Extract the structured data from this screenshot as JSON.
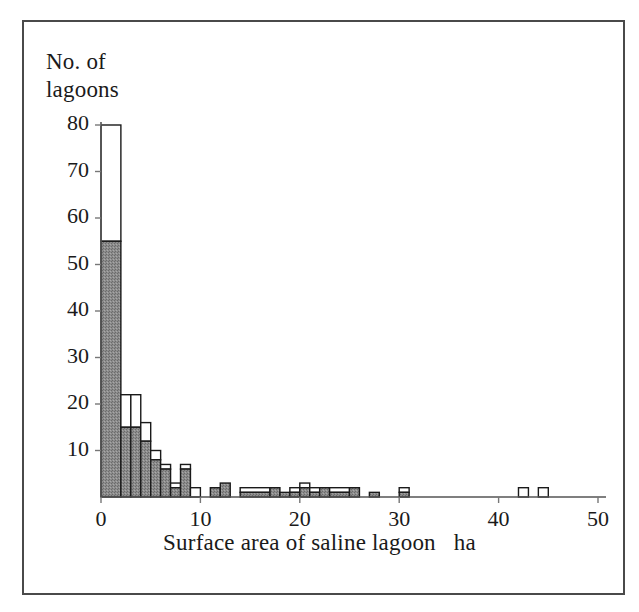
{
  "figure": {
    "background_color": "#ffffff",
    "frame_color": "#4a4a4a",
    "bar_fill_color": "#808080",
    "bar_edge_color": "#1a1a1a",
    "bar_open_color": "#ffffff"
  },
  "axes": {
    "ylabel_line1": "No. of",
    "ylabel_line2": "lagoons",
    "xlabel": "Surface area of saline lagoon",
    "xunit": "ha",
    "yticks": [
      0,
      10,
      20,
      30,
      40,
      50,
      60,
      70,
      80
    ],
    "ytick_labels": [
      "",
      "10",
      "20",
      "30",
      "40",
      "50",
      "60",
      "70",
      "80"
    ],
    "xticks": [
      0,
      10,
      20,
      30,
      40,
      50
    ],
    "xtick_labels": [
      "0",
      "10",
      "20",
      "30",
      "40",
      "50"
    ]
  },
  "chart_data": {
    "type": "bar",
    "title": "",
    "xlabel": "Surface area of saline lagoon   ha",
    "ylabel": "No. of lagoons",
    "xlim": [
      0,
      50
    ],
    "ylim": [
      0,
      80
    ],
    "grid": false,
    "legend": false,
    "bin_width": 1,
    "note": "Stacked histogram: shaded (grey) portion plus open (white) portion give the total bar height.",
    "bin_starts": [
      0,
      1,
      2,
      3,
      4,
      5,
      6,
      7,
      8,
      9,
      10,
      11,
      12,
      13,
      14,
      15,
      16,
      17,
      18,
      19,
      20,
      21,
      22,
      23,
      24,
      25,
      26,
      27,
      28,
      29,
      30,
      31,
      32,
      33,
      34,
      35,
      36,
      37,
      38,
      39,
      40,
      41,
      42,
      43,
      44,
      45,
      46,
      47,
      48,
      49
    ],
    "series": [
      {
        "name": "shaded",
        "values": [
          55,
          55,
          15,
          15,
          12,
          12,
          8,
          8,
          6,
          6,
          4,
          4,
          2,
          2,
          2,
          2,
          2,
          2,
          2,
          2,
          1,
          1,
          2,
          2,
          1,
          1,
          1,
          1,
          0,
          0,
          1,
          1,
          0,
          0,
          0,
          0,
          0,
          0,
          0,
          0,
          0,
          0,
          0,
          0,
          0,
          0,
          0,
          0,
          0,
          0
        ]
      },
      {
        "name": "open",
        "values": [
          25,
          25,
          7,
          7,
          4,
          4,
          1,
          1,
          1,
          1,
          3,
          3,
          0,
          0,
          0,
          0,
          0,
          0,
          0,
          0,
          1,
          1,
          1,
          1,
          0,
          0,
          0,
          0,
          0,
          0,
          0,
          0,
          0,
          0,
          0,
          0,
          0,
          0,
          0,
          0,
          0,
          0,
          1,
          1,
          1,
          1,
          0,
          0,
          0,
          0
        ]
      }
    ],
    "bars": [
      {
        "x0": 0,
        "x1": 2,
        "shaded": 55,
        "open": 25
      },
      {
        "x0": 2,
        "x1": 3,
        "shaded": 15,
        "open": 7
      },
      {
        "x0": 3,
        "x1": 4,
        "shaded": 15,
        "open": 7
      },
      {
        "x0": 4,
        "x1": 5,
        "shaded": 12,
        "open": 4
      },
      {
        "x0": 5,
        "x1": 6,
        "shaded": 8,
        "open": 2
      },
      {
        "x0": 6,
        "x1": 7,
        "shaded": 6,
        "open": 1
      },
      {
        "x0": 7,
        "x1": 8,
        "shaded": 2,
        "open": 1
      },
      {
        "x0": 8,
        "x1": 9,
        "shaded": 6,
        "open": 1
      },
      {
        "x0": 9,
        "x1": 10,
        "shaded": 0,
        "open": 2
      },
      {
        "x0": 11,
        "x1": 12,
        "shaded": 2,
        "open": 0
      },
      {
        "x0": 12,
        "x1": 13,
        "shaded": 3,
        "open": 0
      },
      {
        "x0": 14,
        "x1": 17,
        "shaded": 1,
        "open": 1
      },
      {
        "x0": 17,
        "x1": 18,
        "shaded": 2,
        "open": 0
      },
      {
        "x0": 18,
        "x1": 19,
        "shaded": 1,
        "open": 0
      },
      {
        "x0": 19,
        "x1": 20,
        "shaded": 1,
        "open": 1
      },
      {
        "x0": 20,
        "x1": 21,
        "shaded": 2,
        "open": 1
      },
      {
        "x0": 21,
        "x1": 22,
        "shaded": 1,
        "open": 1
      },
      {
        "x0": 22,
        "x1": 23,
        "shaded": 2,
        "open": 0
      },
      {
        "x0": 23,
        "x1": 25,
        "shaded": 1,
        "open": 1
      },
      {
        "x0": 25,
        "x1": 26,
        "shaded": 2,
        "open": 0
      },
      {
        "x0": 27,
        "x1": 28,
        "shaded": 1,
        "open": 0
      },
      {
        "x0": 30,
        "x1": 31,
        "shaded": 1,
        "open": 1
      },
      {
        "x0": 42,
        "x1": 43,
        "shaded": 0,
        "open": 2
      },
      {
        "x0": 44,
        "x1": 45,
        "shaded": 0,
        "open": 2
      }
    ]
  }
}
